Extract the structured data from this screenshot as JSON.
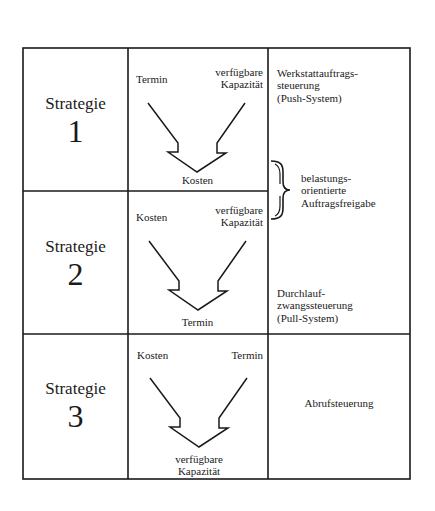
{
  "diagram": {
    "strategies": [
      {
        "label": "Strategie",
        "number": "1",
        "inputs": {
          "left": "Termin",
          "right_line1": "verfügbare",
          "right_line2": "Kapazität"
        },
        "output": {
          "line1": "Kosten",
          "line2": ""
        },
        "method": {
          "line1": "Werkstattauftrags-",
          "line2": "steuerung",
          "line3": "(Push-System)"
        }
      },
      {
        "label": "Strategie",
        "number": "2",
        "inputs": {
          "left": "Kosten",
          "right_line1": "verfügbare",
          "right_line2": "Kapazität"
        },
        "output": {
          "line1": "Termin",
          "line2": ""
        },
        "method": {
          "line1": "Durchlauf-",
          "line2": "zwangssteuerung",
          "line3": "(Pull-System)"
        }
      },
      {
        "label": "Strategie",
        "number": "3",
        "inputs": {
          "left": "Kosten",
          "right_line1": "Termin",
          "right_line2": ""
        },
        "output": {
          "line1": "verfügbare",
          "line2": "Kapazität"
        },
        "method": {
          "line1": "Abrufsteuerung"
        }
      }
    ],
    "bracket_note": {
      "line1": "belastungs-",
      "line2": "orientierte",
      "line3": "Auftragsfreigabe"
    },
    "colors": {
      "line": "#1a1a1a",
      "background": "#ffffff"
    }
  }
}
